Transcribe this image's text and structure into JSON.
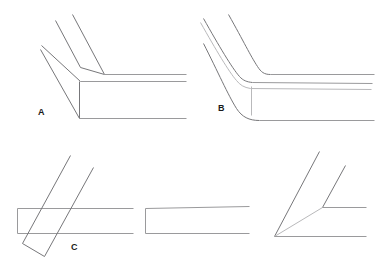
{
  "figure": {
    "background_color": "#ffffff",
    "line_color": "#9a9a9c",
    "line_color_dark": "#77777a",
    "line_color_faint": "#b9b9bb",
    "width": 382,
    "height": 276
  },
  "labels": {
    "a": "A",
    "b": "B",
    "c": "C"
  },
  "panels": [
    {
      "id": "panel-a",
      "label": "A",
      "description": "Mitred corner joint between a diagonal member and a horizontal member, drawn as three parallel edge lines meeting at a mitre line"
    },
    {
      "id": "panel-b",
      "label": "B",
      "description": "Radiused corner joint between a diagonal member and a horizontal member, edge lines curving around the bend"
    },
    {
      "id": "panel-c",
      "label": "C",
      "description": "Lapped crossing joint, a diagonal bar passing over a horizontal bar"
    },
    {
      "id": "panel-d",
      "label": "",
      "description": "Plain straight horizontal bar with a squared end"
    },
    {
      "id": "panel-e",
      "label": "",
      "description": "Fan of three lines radiating from a common vertex"
    }
  ]
}
